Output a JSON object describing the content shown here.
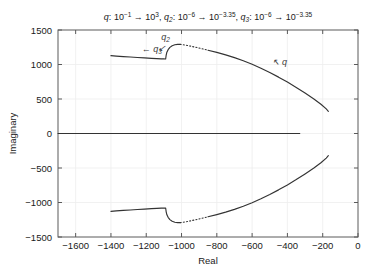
{
  "chart_data": {
    "type": "line",
    "title_parts": [
      {
        "base": "q",
        "sub": "",
        "colon": ": ",
        "from_m": "10",
        "from_e": "−1",
        "arrow": " → ",
        "to_m": "10",
        "to_e": "3",
        "tail": ", "
      },
      {
        "base": "q",
        "sub": "2",
        "colon": ": ",
        "from_m": "10",
        "from_e": "−6",
        "arrow": " → ",
        "to_m": "10",
        "to_e": "−3.35",
        "tail": ", "
      },
      {
        "base": "q",
        "sub": "3",
        "colon": ": ",
        "from_m": "10",
        "from_e": "−6",
        "arrow": " → ",
        "to_m": "10",
        "to_e": "−3.35",
        "tail": ""
      }
    ],
    "xlabel": "Real",
    "ylabel": "Imaginary",
    "xlim": [
      -1700,
      0
    ],
    "ylim": [
      -1500,
      1500
    ],
    "xticks": [
      -1600,
      -1400,
      -1200,
      -1000,
      -800,
      -600,
      -400,
      -200,
      0
    ],
    "xticklabels": [
      "−1600",
      "−1400",
      "−1200",
      "−1000",
      "−800",
      "−600",
      "−400",
      "−200",
      "0"
    ],
    "yticks": [
      -1500,
      -1000,
      -500,
      0,
      500,
      1000,
      1500
    ],
    "yticklabels": [
      "−1500",
      "−1000",
      "−500",
      "0",
      "500",
      "1000",
      "1500"
    ],
    "grid": true,
    "legend": "none",
    "line_color": "#333333",
    "series": [
      {
        "name": "upper-branch-solid-left",
        "style": "solid",
        "points": [
          [
            -1400,
            1128
          ],
          [
            -1370,
            1122
          ],
          [
            -1330,
            1115
          ],
          [
            -1290,
            1108
          ],
          [
            -1250,
            1101
          ],
          [
            -1210,
            1095
          ],
          [
            -1170,
            1089
          ],
          [
            -1140,
            1085
          ],
          [
            -1115,
            1082
          ],
          [
            -1100,
            1081
          ],
          [
            -1092,
            1080
          ],
          [
            -1090,
            1080
          ],
          [
            -1089,
            1098
          ],
          [
            -1087,
            1135
          ],
          [
            -1083,
            1178
          ],
          [
            -1076,
            1215
          ],
          [
            -1066,
            1248
          ],
          [
            -1053,
            1272
          ],
          [
            -1038,
            1286
          ],
          [
            -1022,
            1292
          ],
          [
            -1008,
            1292
          ]
        ]
      },
      {
        "name": "upper-branch-dotted",
        "style": "dotted",
        "points": [
          [
            -1008,
            1292
          ],
          [
            -990,
            1286
          ],
          [
            -968,
            1276
          ],
          [
            -945,
            1264
          ],
          [
            -920,
            1250
          ],
          [
            -895,
            1235
          ],
          [
            -872,
            1221
          ],
          [
            -850,
            1207
          ]
        ]
      },
      {
        "name": "upper-branch-solid-right",
        "style": "solid",
        "points": [
          [
            -850,
            1207
          ],
          [
            -800,
            1175
          ],
          [
            -750,
            1140
          ],
          [
            -700,
            1100
          ],
          [
            -650,
            1055
          ],
          [
            -600,
            1003
          ],
          [
            -550,
            946
          ],
          [
            -500,
            884
          ],
          [
            -450,
            817
          ],
          [
            -400,
            745
          ],
          [
            -350,
            668
          ],
          [
            -300,
            586
          ],
          [
            -250,
            500
          ],
          [
            -210,
            424
          ],
          [
            -180,
            356
          ],
          [
            -168,
            322
          ]
        ]
      },
      {
        "name": "real-axis-branch",
        "style": "solid",
        "points": [
          [
            -1700,
            0
          ],
          [
            -330,
            0
          ]
        ]
      },
      {
        "name": "lower-branch-solid-left",
        "style": "solid",
        "points": [
          [
            -1400,
            -1128
          ],
          [
            -1370,
            -1122
          ],
          [
            -1330,
            -1115
          ],
          [
            -1290,
            -1108
          ],
          [
            -1250,
            -1101
          ],
          [
            -1210,
            -1095
          ],
          [
            -1170,
            -1089
          ],
          [
            -1140,
            -1085
          ],
          [
            -1115,
            -1082
          ],
          [
            -1100,
            -1081
          ],
          [
            -1092,
            -1080
          ],
          [
            -1090,
            -1080
          ],
          [
            -1089,
            -1098
          ],
          [
            -1087,
            -1135
          ],
          [
            -1083,
            -1178
          ],
          [
            -1076,
            -1215
          ],
          [
            -1066,
            -1248
          ],
          [
            -1053,
            -1272
          ],
          [
            -1038,
            -1286
          ],
          [
            -1022,
            -1292
          ],
          [
            -1008,
            -1292
          ]
        ]
      },
      {
        "name": "lower-branch-dotted",
        "style": "dotted",
        "points": [
          [
            -1008,
            -1292
          ],
          [
            -990,
            -1286
          ],
          [
            -968,
            -1276
          ],
          [
            -945,
            -1264
          ],
          [
            -920,
            -1250
          ],
          [
            -895,
            -1235
          ],
          [
            -872,
            -1221
          ],
          [
            -850,
            -1207
          ]
        ]
      },
      {
        "name": "lower-branch-solid-right",
        "style": "solid",
        "points": [
          [
            -850,
            -1207
          ],
          [
            -800,
            -1175
          ],
          [
            -750,
            -1140
          ],
          [
            -700,
            -1100
          ],
          [
            -650,
            -1055
          ],
          [
            -600,
            -1003
          ],
          [
            -550,
            -946
          ],
          [
            -500,
            -884
          ],
          [
            -450,
            -817
          ],
          [
            -400,
            -745
          ],
          [
            -350,
            -668
          ],
          [
            -300,
            -586
          ],
          [
            -250,
            -500
          ],
          [
            -210,
            -424
          ],
          [
            -180,
            -356
          ],
          [
            -168,
            -322
          ]
        ]
      }
    ],
    "annotations": [
      {
        "name": "q3",
        "text": "q",
        "sub": "3",
        "arrow": "←",
        "arrow_side": "left",
        "x": -1225,
        "y": 1180
      },
      {
        "name": "q2",
        "text": "q",
        "sub": "2",
        "arrow": "↙",
        "arrow_side": "below",
        "x": -1115,
        "y": 1355
      },
      {
        "name": "q",
        "text": "q",
        "sub": "",
        "arrow": "↖",
        "arrow_side": "left",
        "x": -490,
        "y": 995
      }
    ]
  }
}
